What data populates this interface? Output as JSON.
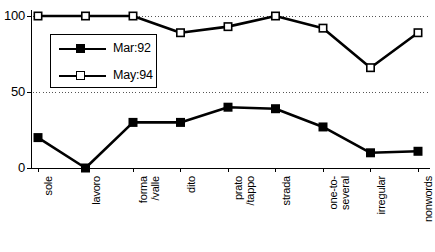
{
  "chart_data": {
    "type": "line",
    "title": "",
    "xlabel": "",
    "ylabel": "",
    "ylim": [
      0,
      100
    ],
    "yticks": [
      0,
      50,
      100
    ],
    "grid": "horizontal-dotted",
    "legend_position": "upper-left-inside",
    "categories": [
      "sole",
      "lavoro",
      "forma\n/valle",
      "dito",
      "prato\n/tappo",
      "strada",
      "one-to-\nseveral",
      "irregular",
      "nonwords"
    ],
    "series": [
      {
        "name": "Mar:92",
        "marker": "filled-square",
        "color": "#000000",
        "values": [
          20,
          0,
          30,
          30,
          40,
          39,
          27,
          10,
          11
        ]
      },
      {
        "name": "May:94",
        "marker": "open-square",
        "color": "#000000",
        "values": [
          100,
          100,
          100,
          89,
          93,
          100,
          92,
          66,
          89
        ]
      }
    ]
  },
  "axis": {
    "ytick_labels": [
      "0",
      "50",
      "100"
    ]
  },
  "legend": {
    "entries": [
      {
        "label": "Mar:92",
        "marker": "filled-square"
      },
      {
        "label": "May:94",
        "marker": "open-square"
      }
    ]
  }
}
